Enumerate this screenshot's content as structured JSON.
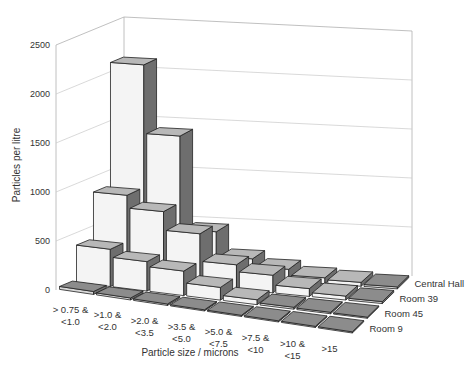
{
  "chart_data": {
    "type": "bar",
    "subtype": "3d-column",
    "title": "",
    "xlabel": "Particle size / microns",
    "ylabel": "Particles per litre",
    "ylim": [
      0,
      2500
    ],
    "yticks": [
      0,
      500,
      1000,
      1500,
      2000,
      2500
    ],
    "grid": true,
    "legend_position": "depth-axis-right",
    "categories": [
      "> 0.75 & <1.0",
      ">1.0 & <2.0",
      ">2.0 & <3.5",
      ">3.5 & <5.0",
      ">5.0 & <7.5",
      ">7.5 & <10",
      ">10 & <15",
      ">15"
    ],
    "category_lines": [
      [
        "> 0.75 &",
        "<1.0"
      ],
      [
        ">1.0 &",
        "<2.0"
      ],
      [
        ">2.0 &",
        "<3.5"
      ],
      [
        ">3.5 &",
        "<5.0"
      ],
      [
        ">5.0 &",
        "<7.5"
      ],
      [
        ">7.5 &",
        "<10"
      ],
      [
        ">10 &",
        "<15"
      ],
      [
        ">15"
      ]
    ],
    "series": [
      {
        "name": "Central Hall",
        "values": [
          2100,
          1400,
          450,
          200,
          120,
          60,
          40,
          20
        ]
      },
      {
        "name": "Room 39",
        "values": [
          850,
          720,
          530,
          250,
          180,
          80,
          40,
          20
        ]
      },
      {
        "name": "Room 45",
        "values": [
          380,
          300,
          250,
          130,
          50,
          20,
          15,
          10
        ]
      },
      {
        "name": "Room 9",
        "values": [
          30,
          20,
          15,
          10,
          5,
          5,
          5,
          5
        ]
      }
    ]
  },
  "colors": {
    "bar_front": "#f4f4f4",
    "bar_top": "#b8b8b8",
    "bar_side": "#6e6e6e",
    "floor_tile": "#8c8c8c",
    "gridline": "#c8c8c8",
    "frame": "#b0b0b0"
  }
}
